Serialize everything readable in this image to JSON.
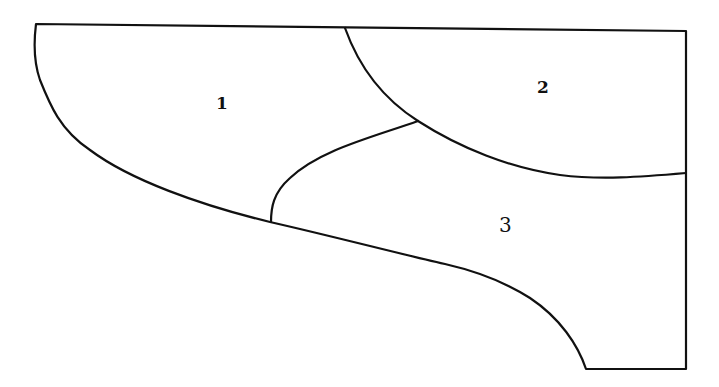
{
  "diagram": {
    "regions": [
      {
        "id": "region-1",
        "label": "1",
        "x": 220,
        "y": 109
      },
      {
        "id": "region-2",
        "label": "2",
        "x": 542,
        "y": 93
      },
      {
        "id": "region-3",
        "label": "3",
        "x": 505,
        "y": 232
      }
    ],
    "stroke_color": "#111111",
    "background": "#ffffff"
  }
}
